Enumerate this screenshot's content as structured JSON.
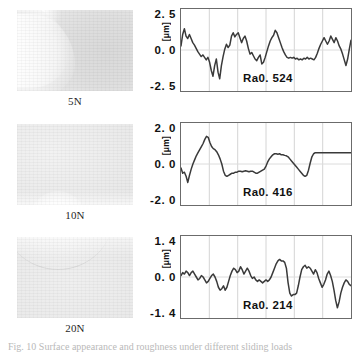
{
  "figure": {
    "caption_partial": "Fig. 10  Surface appearance and roughness under different sliding loads"
  },
  "rows": [
    {
      "load_label": "5N",
      "micrograph_name": "surface-micrograph-5n",
      "axis": {
        "top": "2. 5",
        "mid": "0. 0",
        "bottom": "-2. 5",
        "unit": "[μm]"
      },
      "ra_label": "Ra0. 524"
    },
    {
      "load_label": "10N",
      "micrograph_name": "surface-micrograph-10n",
      "axis": {
        "top": "2. 0",
        "mid": "0. 0",
        "bottom": "-2. 0",
        "unit": "[μm]"
      },
      "ra_label": "Ra0. 416"
    },
    {
      "load_label": "20N",
      "micrograph_name": "surface-micrograph-20n",
      "axis": {
        "top": "1. 4",
        "mid": "0. 0",
        "bottom": "-1. 4",
        "unit": "[μm]"
      },
      "ra_label": "Ra0. 214"
    }
  ],
  "chart_data": [
    {
      "type": "line",
      "title": "Surface roughness profile at 5N",
      "xlabel": "",
      "ylabel": "[μm]",
      "ylim": [
        -2.5,
        2.5
      ],
      "yticks": [
        2.5,
        0.0,
        -2.5
      ],
      "grid": true,
      "gridlines_x": 5,
      "annotation": "Ra0. 524",
      "ra": 0.524,
      "x": [
        0,
        1,
        2,
        3,
        4,
        5,
        6,
        7,
        8,
        9,
        10,
        11,
        12,
        13,
        14,
        15,
        16,
        17,
        18,
        19,
        20,
        21,
        22,
        23,
        24,
        25,
        26,
        27,
        28,
        29,
        30,
        31,
        32,
        33,
        34,
        35,
        36,
        37,
        38,
        39,
        40,
        41,
        42,
        43,
        44,
        45,
        46,
        47,
        48,
        49,
        50,
        51,
        52,
        53,
        54,
        55,
        56,
        57,
        58,
        59,
        60,
        61,
        62,
        63,
        64,
        65,
        66,
        67,
        68,
        69,
        70,
        71,
        72,
        73,
        74,
        75,
        76,
        77,
        78,
        79,
        80,
        81,
        82,
        83,
        84,
        85,
        86,
        87,
        88,
        89,
        90,
        91,
        92,
        93,
        94,
        95,
        96,
        97,
        98,
        99,
        100
      ],
      "values": [
        0.25,
        0.95,
        1.3,
        0.85,
        0.7,
        0.95,
        0.7,
        0.45,
        0.3,
        0.1,
        -0.1,
        -0.25,
        -0.4,
        -0.3,
        -0.45,
        -0.6,
        -0.45,
        -0.75,
        -1.25,
        -1.6,
        -0.95,
        -0.55,
        -1.35,
        -1.75,
        -0.95,
        -0.4,
        0.05,
        0.35,
        0.15,
        0.3,
        0.85,
        1.05,
        0.8,
        0.95,
        1.05,
        0.75,
        0.45,
        0.7,
        0.85,
        0.55,
        0.1,
        -0.25,
        -0.15,
        -0.35,
        -0.55,
        -0.65,
        -0.45,
        -0.3,
        -0.85,
        -0.75,
        -0.45,
        -0.1,
        0.25,
        0.55,
        0.75,
        0.9,
        1.2,
        1.05,
        0.75,
        0.45,
        0.15,
        -0.1,
        -0.3,
        -0.45,
        -0.5,
        -0.45,
        -0.5,
        -0.45,
        -0.55,
        -0.5,
        -0.6,
        -0.55,
        -0.6,
        -0.5,
        -0.55,
        -0.45,
        -0.55,
        -0.5,
        -0.55,
        -0.6,
        -0.45,
        -0.2,
        0.1,
        0.35,
        0.55,
        0.75,
        0.55,
        0.35,
        0.55,
        0.85,
        0.65,
        0.45,
        0.75,
        0.55,
        0.25,
        0.05,
        -0.25,
        -0.6,
        -0.95,
        -0.55,
        0.05,
        0.6
      ]
    },
    {
      "type": "line",
      "title": "Surface roughness profile at 10N",
      "xlabel": "",
      "ylabel": "[μm]",
      "ylim": [
        -2.0,
        2.0
      ],
      "yticks": [
        2.0,
        0.0,
        -2.0
      ],
      "grid": true,
      "gridlines_x": 5,
      "annotation": "Ra0. 416",
      "ra": 0.416,
      "x": [
        0,
        1,
        2,
        3,
        4,
        5,
        6,
        7,
        8,
        9,
        10,
        11,
        12,
        13,
        14,
        15,
        16,
        17,
        18,
        19,
        20,
        21,
        22,
        23,
        24,
        25,
        26,
        27,
        28,
        29,
        30,
        31,
        32,
        33,
        34,
        35,
        36,
        37,
        38,
        39,
        40,
        41,
        42,
        43,
        44,
        45,
        46,
        47,
        48,
        49,
        50,
        51,
        52,
        53,
        54,
        55,
        56,
        57,
        58,
        59,
        60,
        61,
        62,
        63,
        64,
        65,
        66,
        67,
        68,
        69,
        70,
        71,
        72,
        73,
        74,
        75,
        76,
        77,
        78,
        79,
        80,
        81,
        82,
        83,
        84,
        85,
        86,
        87,
        88,
        89,
        90,
        91,
        92,
        93,
        94,
        95,
        96,
        97,
        98,
        99,
        100
      ],
      "values": [
        -0.2,
        -0.45,
        -0.4,
        -0.6,
        -0.9,
        -0.55,
        -0.25,
        0.0,
        0.2,
        0.4,
        0.55,
        0.7,
        0.85,
        1.0,
        1.2,
        1.35,
        1.3,
        1.05,
        0.85,
        0.75,
        0.7,
        0.6,
        0.45,
        0.25,
        0.0,
        -0.35,
        -0.55,
        -0.6,
        -0.55,
        -0.5,
        -0.45,
        -0.45,
        -0.4,
        -0.4,
        -0.35,
        -0.35,
        -0.38,
        -0.35,
        -0.33,
        -0.35,
        -0.38,
        -0.35,
        -0.35,
        -0.4,
        -0.45,
        -0.45,
        -0.4,
        -0.35,
        -0.3,
        -0.25,
        -0.1,
        0.1,
        0.25,
        0.35,
        0.45,
        0.5,
        0.5,
        0.48,
        0.5,
        0.45,
        0.45,
        0.42,
        0.4,
        0.35,
        0.25,
        0.15,
        0.05,
        -0.05,
        -0.15,
        -0.25,
        -0.35,
        -0.45,
        -0.55,
        -0.6,
        -0.55,
        -0.3,
        0.05,
        0.35,
        0.5,
        0.55,
        0.55,
        0.55,
        0.55,
        0.55,
        0.55,
        0.55,
        0.55,
        0.55,
        0.55,
        0.55,
        0.55,
        0.55,
        0.55,
        0.55,
        0.55,
        0.55,
        0.55,
        0.55,
        0.55,
        0.55,
        0.55
      ]
    },
    {
      "type": "line",
      "title": "Surface roughness profile at 20N",
      "xlabel": "",
      "ylabel": "[μm]",
      "ylim": [
        -1.4,
        1.4
      ],
      "yticks": [
        1.4,
        0.0,
        -1.4
      ],
      "grid": true,
      "gridlines_x": 5,
      "annotation": "Ra0. 214",
      "ra": 0.214,
      "x": [
        0,
        1,
        2,
        3,
        4,
        5,
        6,
        7,
        8,
        9,
        10,
        11,
        12,
        13,
        14,
        15,
        16,
        17,
        18,
        19,
        20,
        21,
        22,
        23,
        24,
        25,
        26,
        27,
        28,
        29,
        30,
        31,
        32,
        33,
        34,
        35,
        36,
        37,
        38,
        39,
        40,
        41,
        42,
        43,
        44,
        45,
        46,
        47,
        48,
        49,
        50,
        51,
        52,
        53,
        54,
        55,
        56,
        57,
        58,
        59,
        60,
        61,
        62,
        63,
        64,
        65,
        66,
        67,
        68,
        69,
        70,
        71,
        72,
        73,
        74,
        75,
        76,
        77,
        78,
        79,
        80,
        81,
        82,
        83,
        84,
        85,
        86,
        87,
        88,
        89,
        90,
        91,
        92,
        93,
        94,
        95,
        96,
        97,
        98,
        99,
        100
      ],
      "values": [
        0.05,
        0.15,
        0.1,
        0.2,
        0.15,
        0.05,
        0.15,
        0.2,
        0.1,
        0.0,
        -0.1,
        -0.05,
        0.05,
        0.0,
        -0.1,
        -0.2,
        -0.15,
        -0.05,
        0.05,
        0.1,
        0.0,
        -0.15,
        -0.35,
        -0.45,
        -0.4,
        -0.3,
        -0.45,
        -0.35,
        -0.15,
        0.05,
        0.2,
        0.3,
        0.25,
        0.15,
        0.2,
        0.35,
        0.25,
        0.1,
        0.2,
        0.3,
        0.2,
        0.05,
        -0.05,
        0.0,
        -0.1,
        -0.15,
        -0.1,
        -0.15,
        -0.2,
        -0.15,
        -0.1,
        -0.15,
        -0.1,
        0.0,
        0.15,
        0.3,
        0.45,
        0.55,
        0.6,
        0.55,
        0.55,
        0.5,
        0.3,
        -0.2,
        -0.55,
        -0.65,
        -0.6,
        -0.6,
        -0.55,
        -0.3,
        0.0,
        0.25,
        0.35,
        0.4,
        0.3,
        0.35,
        0.3,
        0.2,
        0.1,
        0.25,
        0.15,
        -0.05,
        -0.2,
        -0.35,
        -0.25,
        -0.1,
        0.1,
        0.2,
        0.05,
        -0.15,
        -0.45,
        -0.8,
        -1.05,
        -0.85,
        -0.55,
        -0.35,
        -0.2,
        -0.1,
        -0.15,
        -0.25,
        -0.3
      ]
    }
  ],
  "colors": {
    "trace": "#3a3a3a",
    "frame": "#6b6b6b",
    "grid": "#d4d4d4",
    "text": "#111111",
    "background": "#ffffff"
  }
}
